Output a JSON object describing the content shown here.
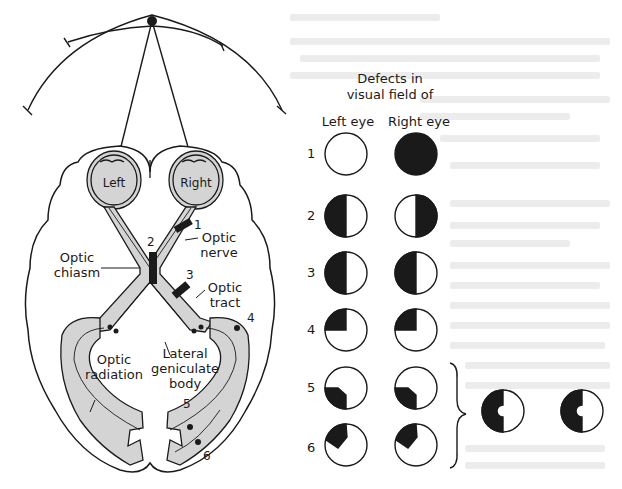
{
  "figure": {
    "header": {
      "title_line1": "Defects in",
      "title_line2": "visual field of",
      "left_eye": "Left eye",
      "right_eye": "Right eye"
    },
    "brain_labels": {
      "left_eye": "Left",
      "right_eye": "Right",
      "optic_chiasm_1": "Optic",
      "optic_chiasm_2": "chiasm",
      "optic_nerve_1": "Optic",
      "optic_nerve_2": "nerve",
      "optic_tract_1": "Optic",
      "optic_tract_2": "tract",
      "optic_radiation_1": "Optic",
      "optic_radiation_2": "radiation",
      "lgb_1": "Lateral",
      "lgb_2": "geniculate",
      "lgb_3": "body"
    },
    "lesion_numbers": [
      "1",
      "2",
      "3",
      "4",
      "5",
      "6"
    ],
    "defect_rows": [
      {
        "num": "1",
        "left": "none",
        "right": "full"
      },
      {
        "num": "2",
        "left": "left-half",
        "right": "right-half"
      },
      {
        "num": "3",
        "left": "left-half",
        "right": "left-half"
      },
      {
        "num": "4",
        "left": "upper-left-quadrant",
        "right": "upper-left-quadrant"
      },
      {
        "num": "5",
        "left": "lower-left-partial",
        "right": "lower-left-partial"
      },
      {
        "num": "6",
        "left": "upper-left-partial",
        "right": "upper-left-partial"
      }
    ],
    "combined_result": "left homonymous hemianopia with macular sparing (both eyes)",
    "colors": {
      "ink": "#1a1a1a",
      "shade": "#d4d4d4",
      "paper": "#ffffff"
    }
  }
}
